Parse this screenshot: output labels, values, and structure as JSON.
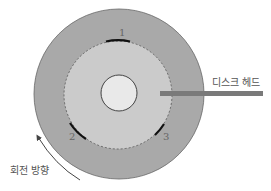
{
  "diagram": {
    "labels": {
      "disk_head": "디스크 헤드",
      "rotation_direction": "회전 방향",
      "sector_1": "1",
      "sector_2": "2",
      "sector_3": "3"
    },
    "colors": {
      "platter_outer": "#a8a8a8",
      "platter_track_area": "#c8c8c8",
      "hub": "#e8e8e8",
      "head_bar": "#7a7a7a",
      "sector_mark": "#111111",
      "outline": "#555555"
    }
  }
}
